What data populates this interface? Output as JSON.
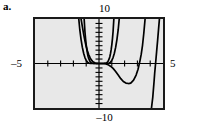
{
  "part_label": "a.",
  "figure": {
    "kind": "graphing-calculator-window",
    "frame_color": "#1a1a1a",
    "screen_color": "#e8e8e8",
    "curve_color": "#000000",
    "axis_color": "#000000"
  },
  "axis_labels": {
    "y_max": "10",
    "y_min": "–10",
    "x_min": "–5",
    "x_max": "5"
  },
  "chart_data": {
    "type": "line",
    "title": "",
    "xlabel": "",
    "ylabel": "",
    "xlim": [
      -5,
      5
    ],
    "ylim": [
      -10,
      10
    ],
    "grid": false,
    "legend": "none",
    "x_tick_labels": [
      "–5",
      "5"
    ],
    "y_tick_labels": [
      "10",
      "–10"
    ],
    "x_tick_interval": 1,
    "y_tick_interval": 1,
    "x_axis_ticks": [
      -4,
      -3,
      -2,
      -1,
      1,
      2,
      3,
      4
    ],
    "y_axis_ticks": [
      -9,
      -8,
      -7,
      -6,
      -5,
      -4,
      -3,
      -2,
      -1,
      1,
      2,
      3,
      4,
      5,
      6,
      7,
      8,
      9
    ],
    "series": [
      {
        "name": "steep-even-power-outer",
        "note": "very steep even-degree power curve, vertex at origin, leftmost arm exits top of window near x = -1.55",
        "x": [
          -1.58,
          -1.5,
          -1.4,
          -1.3,
          -1.2,
          -1.1,
          -1.0,
          -0.9,
          -0.8,
          -0.7,
          -0.6,
          -0.5,
          -0.4,
          -0.3,
          -0.2,
          -0.1,
          0.0,
          0.1,
          0.2,
          0.3,
          0.4,
          0.5,
          0.6,
          0.7,
          0.8,
          0.9,
          1.0,
          1.1,
          1.2,
          1.3,
          1.4,
          1.5,
          1.58
        ],
        "y": [
          10.0,
          7.59,
          5.38,
          3.62,
          2.3,
          1.34,
          0.7,
          0.31,
          0.11,
          0.03,
          0.01,
          0.0,
          0.0,
          0.0,
          0.0,
          0.0,
          0.0,
          0.0,
          0.0,
          0.0,
          0.0,
          0.0,
          0.01,
          0.03,
          0.11,
          0.31,
          0.7,
          1.34,
          2.3,
          3.62,
          5.38,
          7.59,
          10.0
        ]
      },
      {
        "name": "steep-even-power-inner",
        "note": "narrower even-degree power curve, vertex at origin, leftmost arm exits top of window near x = -1.15",
        "x": [
          -1.16,
          -1.1,
          -1.05,
          -1.0,
          -0.95,
          -0.9,
          -0.85,
          -0.8,
          -0.7,
          -0.6,
          -0.5,
          -0.4,
          -0.3,
          -0.2,
          -0.1,
          0.0,
          0.1,
          0.2,
          0.3,
          0.4,
          0.5,
          0.6,
          0.7,
          0.8,
          0.85,
          0.9,
          0.95,
          1.0,
          1.05,
          1.1,
          1.16
        ],
        "y": [
          10.0,
          7.2,
          5.55,
          4.2,
          3.1,
          2.25,
          1.58,
          1.08,
          0.45,
          0.16,
          0.05,
          0.01,
          0.0,
          0.0,
          0.0,
          0.0,
          0.0,
          0.0,
          0.0,
          0.01,
          0.05,
          0.16,
          0.45,
          1.08,
          1.58,
          2.25,
          3.1,
          4.2,
          5.55,
          7.2,
          10.0
        ]
      },
      {
        "name": "shifted-quartic",
        "note": "broad curve tangent to the x-axis just right of origin, dips to a minimum of about y = -4.4 near x = 2.4, then rises steeply and exits the top of the window near x = 3.6",
        "x": [
          -1.4,
          -1.3,
          -1.2,
          -1.1,
          -1.0,
          -0.9,
          -0.8,
          -0.7,
          -0.6,
          -0.5,
          -0.4,
          -0.3,
          -0.2,
          -0.1,
          0.0,
          0.1,
          0.2,
          0.3,
          0.4,
          0.5,
          0.7,
          0.9,
          1.1,
          1.3,
          1.5,
          1.7,
          1.9,
          2.1,
          2.3,
          2.4,
          2.5,
          2.7,
          2.9,
          3.05,
          3.2,
          3.3,
          3.4,
          3.5,
          3.6
        ],
        "y": [
          10.0,
          8.3,
          6.6,
          5.1,
          3.8,
          2.8,
          1.95,
          1.3,
          0.82,
          0.48,
          0.26,
          0.12,
          0.04,
          0.01,
          0.0,
          0.0,
          0.0,
          0.0,
          0.0,
          -0.05,
          -0.25,
          -0.6,
          -1.1,
          -1.8,
          -2.6,
          -3.4,
          -4.05,
          -4.4,
          -4.5,
          -4.48,
          -4.35,
          -3.75,
          -2.6,
          -1.3,
          0.6,
          2.1,
          4.1,
          6.8,
          10.0
        ]
      },
      {
        "name": "rightmost-arm",
        "note": "steep rising arm at the right edge of the window, crossing the x-axis near x = 4.35 and exiting the top near x = 4.7",
        "x": [
          4.1,
          4.2,
          4.3,
          4.35,
          4.42,
          4.5,
          4.58,
          4.65,
          4.72
        ],
        "y": [
          -10.0,
          -7.6,
          -4.1,
          -2.2,
          0.0,
          2.6,
          5.2,
          7.6,
          10.0
        ]
      }
    ]
  }
}
